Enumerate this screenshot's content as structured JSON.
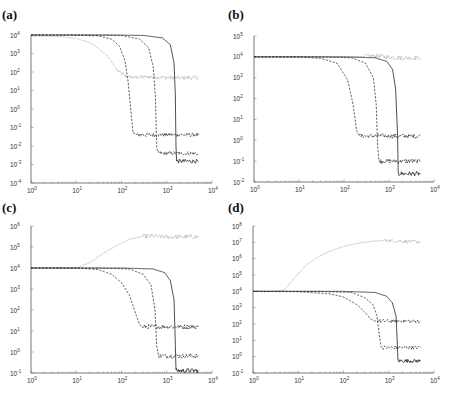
{
  "figure": {
    "panels": [
      "(a)",
      "(b)",
      "(c)",
      "(d)"
    ]
  },
  "chart_data": [
    {
      "panel": "(a)",
      "type": "line",
      "title": "",
      "xlabel": "",
      "ylabel": "",
      "xscale": "log",
      "yscale": "log",
      "xlim": [
        1,
        10000
      ],
      "ylim": [
        0.0001,
        10000
      ],
      "xticks": [
        "10^0",
        "10^1",
        "10^2",
        "10^3",
        "10^4"
      ],
      "yticks": [
        "10^4",
        "10^3",
        "10^2",
        "10^1",
        "10^0",
        "10^-1",
        "10^-2",
        "10^-3",
        "10^-4"
      ],
      "grid": false,
      "legend": null,
      "box": {
        "x0": 31,
        "x1": 212,
        "y0": 35,
        "y1": 183
      },
      "series": [
        {
          "name": "dotted-gray",
          "style": "dotted",
          "color": "#aaaaaa",
          "x": [
            1,
            5,
            10,
            20,
            30,
            50,
            80,
            120,
            200,
            400,
            1000,
            2000,
            5000
          ],
          "y": [
            9000,
            8000,
            6500,
            4000,
            2000,
            700,
            120,
            60,
            50,
            55,
            50,
            48,
            50
          ],
          "noisy_from": 80
        },
        {
          "name": "dash-1",
          "style": "dashed",
          "color": "#333333",
          "x": [
            1,
            10,
            30,
            60,
            90,
            120,
            140,
            160,
            180,
            220,
            500,
            1000,
            5000
          ],
          "y": [
            10000,
            9800,
            9000,
            6000,
            2500,
            400,
            30,
            1,
            0.05,
            0.04,
            0.04,
            0.04,
            0.04
          ],
          "noisy_from": 180
        },
        {
          "name": "dash-2",
          "style": "dashed",
          "color": "#333333",
          "x": [
            1,
            20,
            100,
            250,
            400,
            500,
            560,
            600,
            620,
            700,
            2000,
            5000
          ],
          "y": [
            10000,
            9900,
            9500,
            6000,
            2000,
            200,
            5,
            0.01,
            0.005,
            0.004,
            0.004,
            0.004
          ],
          "noisy_from": 620
        },
        {
          "name": "solid",
          "style": "solid",
          "color": "#222222",
          "x": [
            1,
            50,
            300,
            800,
            1200,
            1450,
            1550,
            1600,
            1650,
            5000
          ],
          "y": [
            10000,
            9950,
            9500,
            7000,
            3000,
            300,
            5,
            0.01,
            0.0015,
            0.0015
          ],
          "noisy_from": 1650
        }
      ]
    },
    {
      "panel": "(b)",
      "type": "line",
      "title": "",
      "xlabel": "",
      "ylabel": "",
      "xscale": "log",
      "yscale": "log",
      "xlim": [
        1,
        10000
      ],
      "ylim": [
        0.01,
        100000
      ],
      "xticks": [
        "10^0",
        "10^1",
        "10^2",
        "10^3",
        "10^4"
      ],
      "yticks": [
        "10^5",
        "10^4",
        "10^3",
        "10^2",
        "10^1",
        "10^0",
        "10^-1",
        "10^-2"
      ],
      "grid": false,
      "legend": null,
      "box": {
        "x0": 254,
        "x1": 434,
        "y0": 36,
        "y1": 182
      },
      "series": [
        {
          "name": "dotted-gray",
          "style": "dotted",
          "color": "#aaaaaa",
          "x": [
            1,
            10,
            100,
            300,
            600,
            1000,
            2000,
            5000
          ],
          "y": [
            10000,
            10000,
            10000,
            10500,
            11000,
            9500,
            9000,
            9000
          ],
          "noisy_from": 300
        },
        {
          "name": "dash-1",
          "style": "dashed",
          "color": "#333333",
          "x": [
            1,
            10,
            30,
            70,
            120,
            160,
            190,
            220,
            400,
            1000,
            5000
          ],
          "y": [
            10000,
            9900,
            8500,
            5000,
            800,
            50,
            3,
            1.6,
            1.6,
            1.6,
            1.6
          ],
          "noisy_from": 220
        },
        {
          "name": "dash-2",
          "style": "dashed",
          "color": "#333333",
          "x": [
            1,
            30,
            150,
            300,
            450,
            520,
            560,
            600,
            700,
            2000,
            5000
          ],
          "y": [
            10000,
            9900,
            9000,
            5000,
            1000,
            50,
            0.5,
            0.1,
            0.1,
            0.1,
            0.1
          ],
          "noisy_from": 600
        },
        {
          "name": "solid",
          "style": "solid",
          "color": "#222222",
          "x": [
            1,
            100,
            500,
            900,
            1200,
            1400,
            1550,
            1600,
            1650,
            5000
          ],
          "y": [
            10000,
            9950,
            9000,
            6000,
            2500,
            300,
            2,
            0.03,
            0.025,
            0.025
          ],
          "noisy_from": 1650
        }
      ]
    },
    {
      "panel": "(c)",
      "type": "line",
      "title": "",
      "xlabel": "",
      "ylabel": "",
      "xscale": "log",
      "yscale": "log",
      "xlim": [
        1,
        10000
      ],
      "ylim": [
        0.1,
        1000000
      ],
      "xticks": [
        "10^0",
        "10^1",
        "10^2",
        "10^3",
        "10^4"
      ],
      "yticks": [
        "10^6",
        "10^5",
        "10^4",
        "10^3",
        "10^2",
        "10^1",
        "10^0",
        "10^-1"
      ],
      "grid": false,
      "legend": null,
      "box": {
        "x0": 31,
        "x1": 212,
        "y0": 226,
        "y1": 373
      },
      "series": [
        {
          "name": "dotted-gray",
          "style": "dotted",
          "color": "#aaaaaa",
          "x": [
            1,
            5,
            10,
            20,
            40,
            80,
            150,
            300,
            500,
            1000,
            2000,
            5000
          ],
          "y": [
            10000,
            10000,
            10000,
            18000,
            50000,
            120000,
            230000,
            320000,
            330000,
            300000,
            310000,
            300000
          ],
          "noisy_from": 300
        },
        {
          "name": "dash-1",
          "style": "dashed",
          "color": "#333333",
          "x": [
            1,
            10,
            30,
            60,
            100,
            150,
            200,
            250,
            300,
            400,
            1000,
            5000
          ],
          "y": [
            10000,
            9900,
            8500,
            5000,
            2000,
            500,
            80,
            20,
            16,
            16,
            16,
            16
          ],
          "noisy_from": 300
        },
        {
          "name": "dash-2",
          "style": "dashed",
          "color": "#333333",
          "x": [
            1,
            30,
            150,
            300,
            450,
            550,
            600,
            650,
            700,
            2000,
            5000
          ],
          "y": [
            10000,
            9900,
            9000,
            5000,
            1500,
            100,
            2,
            0.7,
            0.65,
            0.65,
            0.65
          ],
          "noisy_from": 650
        },
        {
          "name": "solid",
          "style": "solid",
          "color": "#222222",
          "x": [
            1,
            100,
            500,
            900,
            1200,
            1450,
            1550,
            1600,
            1650,
            5000
          ],
          "y": [
            10000,
            9950,
            9000,
            6000,
            2500,
            300,
            2,
            0.15,
            0.13,
            0.13
          ],
          "noisy_from": 1650
        }
      ]
    },
    {
      "panel": "(d)",
      "type": "line",
      "title": "",
      "xlabel": "",
      "ylabel": "",
      "xscale": "log",
      "yscale": "log",
      "xlim": [
        1,
        10000
      ],
      "ylim": [
        0.1,
        100000000
      ],
      "xticks": [
        "10^0",
        "10^1",
        "10^2",
        "10^3",
        "10^4"
      ],
      "yticks": [
        "10^8",
        "10^7",
        "10^6",
        "10^5",
        "10^4",
        "10^3",
        "10^2",
        "10^1",
        "10^0",
        "10^-1"
      ],
      "grid": false,
      "legend": null,
      "box": {
        "x0": 253,
        "x1": 434,
        "y0": 226,
        "y1": 373
      },
      "series": [
        {
          "name": "dotted-gray",
          "style": "dotted",
          "color": "#aaaaaa",
          "x": [
            1,
            3,
            5,
            8,
            15,
            30,
            60,
            120,
            250,
            500,
            800,
            1500,
            3000,
            5000
          ],
          "y": [
            10000,
            10000,
            12000,
            60000,
            400000,
            1500000,
            3500000,
            6500000,
            9500000,
            12000000,
            13000000,
            12000000,
            11000000,
            11000000
          ],
          "noisy_from": 800
        },
        {
          "name": "dash-1",
          "style": "dashed",
          "color": "#333333",
          "x": [
            1,
            10,
            50,
            100,
            200,
            300,
            400,
            500,
            600,
            1000,
            5000
          ],
          "y": [
            10000,
            9500,
            7000,
            4500,
            1500,
            500,
            200,
            150,
            150,
            150,
            150
          ],
          "noisy_from": 600
        },
        {
          "name": "dash-2",
          "style": "dashed",
          "color": "#333333",
          "x": [
            1,
            30,
            150,
            300,
            450,
            550,
            620,
            680,
            750,
            2000,
            5000
          ],
          "y": [
            10000,
            9900,
            8500,
            4000,
            1500,
            300,
            20,
            4,
            3.6,
            3.6,
            3.6
          ],
          "noisy_from": 750
        },
        {
          "name": "solid",
          "style": "solid",
          "color": "#222222",
          "x": [
            1,
            100,
            500,
            900,
            1200,
            1450,
            1550,
            1600,
            1650,
            5000
          ],
          "y": [
            10000,
            9950,
            8500,
            5000,
            2000,
            300,
            5,
            0.6,
            0.55,
            0.55
          ],
          "noisy_from": 1650
        }
      ]
    }
  ]
}
